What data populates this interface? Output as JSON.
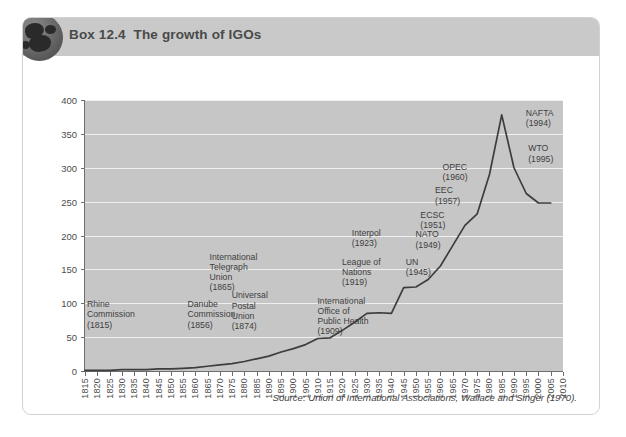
{
  "box": {
    "title": "Box 12.4  The growth of IGOs",
    "icon": "globe-icon",
    "source": "Source: Union of International Associations, Wallace and Singer (1970).",
    "header_bg": "#c9c9c9",
    "plot_bg": "#c6c6c6",
    "line_color": "#3d3d3d"
  },
  "chart_data": {
    "type": "line",
    "title": "Box 12.4  The growth of IGOs",
    "xlabel": "",
    "ylabel": "",
    "xlim": [
      1815,
      2010
    ],
    "ylim": [
      0,
      400
    ],
    "ytick_step": 50,
    "xtick_step": 5,
    "grid": true,
    "legend": "none",
    "yticks": [
      "0",
      "50",
      "100",
      "150",
      "200",
      "250",
      "300",
      "350",
      "400"
    ],
    "xticks": [
      "1815",
      "1820",
      "1825",
      "1830",
      "1835",
      "1840",
      "1845",
      "1850",
      "1855",
      "1860",
      "1865",
      "1870",
      "1875",
      "1880",
      "1885",
      "1890",
      "1895",
      "1900",
      "1905",
      "1910",
      "1915",
      "1920",
      "1925",
      "1930",
      "1935",
      "1940",
      "1945",
      "1950",
      "1955",
      "1960",
      "1965",
      "1970",
      "1975",
      "1980",
      "1985",
      "1990",
      "1995",
      "2000",
      "2005",
      "2010"
    ],
    "series": [
      {
        "name": "Number of IGOs",
        "x": [
          1815,
          1820,
          1825,
          1830,
          1835,
          1840,
          1845,
          1850,
          1855,
          1860,
          1865,
          1870,
          1875,
          1880,
          1885,
          1890,
          1895,
          1900,
          1905,
          1910,
          1915,
          1920,
          1925,
          1930,
          1935,
          1940,
          1945,
          1950,
          1955,
          1960,
          1965,
          1970,
          1975,
          1980,
          1985,
          1990,
          1995,
          2000,
          2005
        ],
        "values": [
          1,
          1,
          1,
          2,
          2,
          2,
          3,
          3,
          4,
          5,
          7,
          9,
          11,
          14,
          18,
          22,
          28,
          33,
          39,
          48,
          49,
          60,
          72,
          85,
          86,
          85,
          123,
          124,
          135,
          155,
          185,
          215,
          232,
          290,
          378,
          300,
          262,
          248,
          248
        ]
      }
    ],
    "annotations": [
      {
        "label": "Rhine\nCommission\n(1815)",
        "year": 1815,
        "value_level": 100
      },
      {
        "label": "Danube\nCommission\n(1856)",
        "year": 1856,
        "value_level": 100
      },
      {
        "label": "Universal\nPostal\nUnion\n(1874)",
        "year": 1874,
        "value_level": 113
      },
      {
        "label": "International\nTelegraph\nUnion\n(1865)",
        "year": 1865,
        "value_level": 170
      },
      {
        "label": "International\nOffice of\nPublic Health\n(1909)",
        "year": 1909,
        "value_level": 105
      },
      {
        "label": "League of\nNations\n(1919)",
        "year": 1919,
        "value_level": 163
      },
      {
        "label": "Interpol\n(1923)",
        "year": 1923,
        "value_level": 205
      },
      {
        "label": "UN\n(1945)",
        "year": 1945,
        "value_level": 163
      },
      {
        "label": "NATO\n(1949)",
        "year": 1949,
        "value_level": 203
      },
      {
        "label": "ECSC\n(1951)",
        "year": 1951,
        "value_level": 232
      },
      {
        "label": "EEC\n(1957)",
        "year": 1957,
        "value_level": 268
      },
      {
        "label": "OPEC\n(1960)",
        "year": 1960,
        "value_level": 303
      },
      {
        "label": "NAFTA\n(1994)",
        "year": 1994,
        "value_level": 383
      },
      {
        "label": "WTO\n(1995)",
        "year": 1995,
        "value_level": 330
      }
    ]
  }
}
